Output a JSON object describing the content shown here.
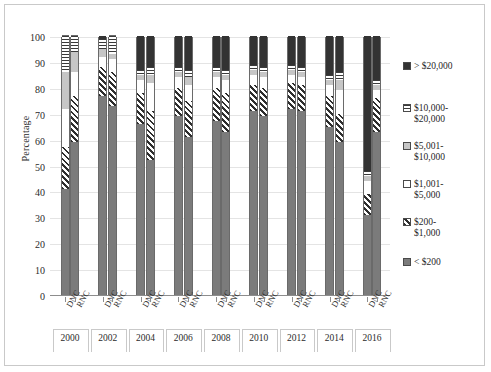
{
  "chart_data": {
    "type": "bar",
    "subtype": "stacked-percentage-column",
    "title": "",
    "xlabel": "",
    "ylabel": "Percentage",
    "ylim": [
      0,
      100
    ],
    "yticks": [
      0,
      10,
      20,
      30,
      40,
      50,
      60,
      70,
      80,
      90,
      100
    ],
    "grid": true,
    "legend_position": "right",
    "group_labels": [
      "2000",
      "2002",
      "2004",
      "2006",
      "2008",
      "2010",
      "2012",
      "2014",
      "2016"
    ],
    "categories": [
      "DNC 2000",
      "RNC 2000",
      "DNC 2002",
      "RNC 2002",
      "DNC 2004",
      "RNC 2004",
      "DNC 2006",
      "RNC 2006",
      "DNC 2008",
      "RNC 2008",
      "DNC 2010",
      "RNC 2010",
      "DNC 2012",
      "RNC 2012",
      "DNC 2014",
      "RNC 2014",
      "DNC 2016",
      "RNC 2016"
    ],
    "tick_labels": [
      "DNC",
      "RNC",
      "DNC",
      "RNC",
      "DNC",
      "RNC",
      "DNC",
      "RNC",
      "DNC",
      "RNC",
      "DNC",
      "RNC",
      "DNC",
      "RNC",
      "DNC",
      "RNC",
      "DNC",
      "RNC"
    ],
    "series": [
      {
        "name": "< $200",
        "pattern": "solid-gray",
        "color": "#7b7b7b",
        "values": [
          41,
          59,
          77,
          73,
          66,
          52,
          69,
          61,
          67,
          63,
          71,
          69,
          72,
          71,
          65,
          59,
          31,
          63
        ]
      },
      {
        "name": "$200-$1,000",
        "pattern": "diagonal-hatch",
        "color": "#2e2e2e",
        "values": [
          16,
          18,
          11,
          13,
          12,
          19,
          11,
          14,
          13,
          15,
          10,
          11,
          10,
          10,
          12,
          11,
          8,
          13
        ]
      },
      {
        "name": "$1,001-$5,000",
        "pattern": "white",
        "color": "#ffffff",
        "values": [
          15,
          9,
          4,
          5,
          5,
          11,
          4,
          6,
          4,
          5,
          4,
          4,
          3,
          3,
          4,
          9,
          5,
          3
        ]
      },
      {
        "name": "$5,001-$10,000",
        "pattern": "light-gray",
        "color": "#c6c6c6",
        "values": [
          14,
          8,
          3,
          2,
          2,
          3,
          2,
          3,
          2,
          2,
          2,
          2,
          2,
          2,
          2,
          4,
          2,
          2
        ]
      },
      {
        "name": "$10,000-$20,000",
        "pattern": "horizontal-lines",
        "color": "#3a3a3a",
        "values": [
          14,
          6,
          4,
          7,
          2,
          3,
          2,
          3,
          2,
          2,
          2,
          2,
          2,
          2,
          2,
          3,
          2,
          2
        ]
      },
      {
        "name": "> $20,000",
        "pattern": "solid-dark",
        "color": "#333333",
        "values": [
          0,
          0,
          1,
          0,
          13,
          12,
          12,
          13,
          12,
          13,
          11,
          12,
          11,
          12,
          15,
          14,
          52,
          17
        ]
      }
    ],
    "legend_entries": [
      "> $20,000",
      "$10,000-\n$20,000",
      "$5,001-\n$10,000",
      "$1,001-\n$5,000",
      "$200-\n$1,000",
      "< $200"
    ]
  }
}
